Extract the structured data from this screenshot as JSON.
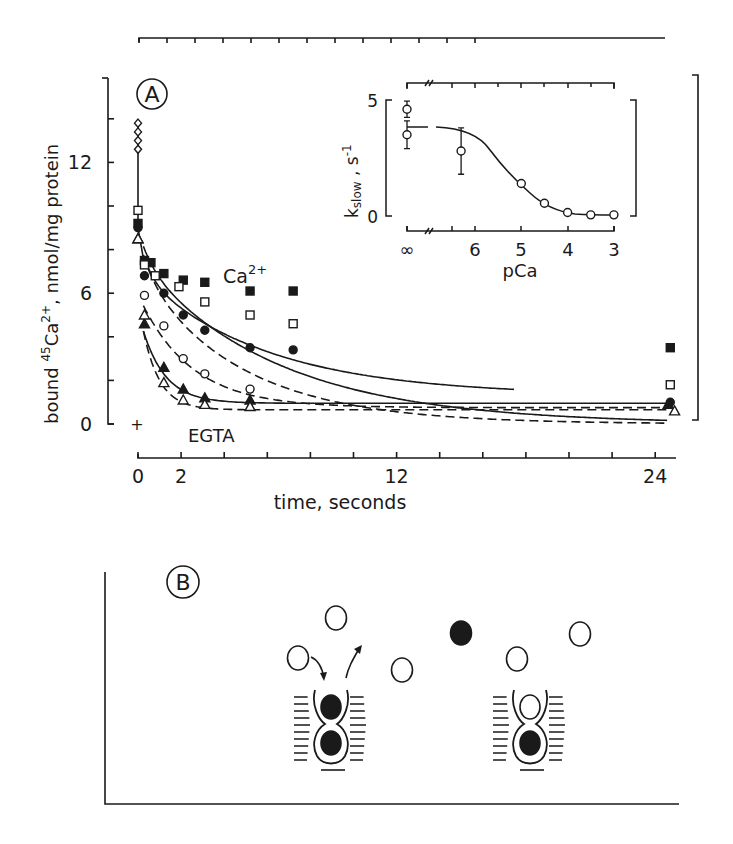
{
  "figure": {
    "panel_a_label": "A",
    "panel_b_label": "B"
  },
  "chart_data": [
    {
      "type": "scatter",
      "panel": "A",
      "title": "",
      "xlabel": "time, seconds",
      "ylabel": "bound 45Ca2+, nmol/mg protein",
      "ylabel_parts": {
        "pre": "bound ",
        "sup_mass": "45",
        "ion": "Ca",
        "sup_charge": "2+",
        "post": ", nmol/mg protein"
      },
      "xlim": [
        0,
        25.5
      ],
      "ylim": [
        0,
        15
      ],
      "x_ticks": [
        0,
        2,
        12,
        24
      ],
      "x_minor_ticks": [
        0,
        2,
        4,
        6,
        8,
        10,
        12,
        14,
        16,
        18,
        20,
        22,
        24
      ],
      "y_ticks": [
        0,
        6,
        12
      ],
      "y_minor_ticks": [
        0,
        2,
        4,
        6,
        8,
        10,
        12,
        14
      ],
      "annotations": [
        {
          "text": "Ca2+",
          "x": 4.2,
          "y": 7.0
        },
        {
          "text": "EGTA",
          "x": 2.3,
          "y": -0.7
        },
        {
          "text": "+",
          "x": 0.0,
          "y": 0.0
        }
      ],
      "initial_points": {
        "marker": "open-diamond",
        "x": 0,
        "y": [
          12.6,
          13.0,
          13.4,
          13.8
        ]
      },
      "series": [
        {
          "name": "filled squares",
          "marker": "filled-square",
          "line": "solid",
          "x": [
            0,
            0.3,
            0.6,
            1.2,
            2.1,
            3.1,
            5.2,
            7.2,
            24.7
          ],
          "y": [
            9.2,
            7.5,
            7.4,
            6.9,
            6.6,
            6.5,
            6.1,
            6.1,
            3.5
          ]
        },
        {
          "name": "open squares",
          "marker": "open-square",
          "line": "dashed",
          "x": [
            0,
            0.3,
            0.8,
            1.9,
            3.1,
            5.2,
            7.2,
            24.7
          ],
          "y": [
            9.8,
            7.3,
            6.8,
            6.3,
            5.6,
            5.0,
            4.6,
            1.8
          ]
        },
        {
          "name": "filled circles",
          "marker": "filled-circle",
          "line": "solid",
          "x": [
            0,
            0.3,
            1.2,
            2.1,
            3.1,
            5.2,
            7.2,
            24.7
          ],
          "y": [
            9.0,
            6.8,
            6.0,
            5.0,
            4.3,
            3.5,
            3.4,
            1.0
          ]
        },
        {
          "name": "open circles",
          "marker": "open-circle",
          "line": "dashed",
          "x": [
            0.3,
            1.2,
            2.1,
            3.1,
            5.2
          ],
          "y": [
            5.9,
            4.5,
            3.0,
            2.3,
            1.6
          ]
        },
        {
          "name": "filled triangles",
          "marker": "filled-triangle",
          "line": "solid",
          "x": [
            0,
            0.3,
            1.2,
            2.1,
            3.1,
            5.2,
            24.6
          ],
          "y": [
            8.5,
            4.6,
            2.6,
            1.6,
            1.2,
            1.1,
            0.9
          ]
        },
        {
          "name": "open triangles",
          "marker": "open-triangle",
          "line": "dashed",
          "x": [
            0,
            0.3,
            1.2,
            2.1,
            3.1,
            5.2,
            24.9
          ],
          "y": [
            8.5,
            5.0,
            1.9,
            1.1,
            0.9,
            0.8,
            0.6
          ]
        }
      ],
      "grid": false,
      "legend": "none"
    },
    {
      "type": "scatter",
      "panel": "A-inset",
      "title": "",
      "xlabel": "pCa",
      "ylabel": "k_slow , s-1",
      "ylabel_parts": {
        "main": "k",
        "sub": "slow",
        "post": " , s",
        "sup": "-1"
      },
      "x_tick_labels": [
        "∞",
        "6",
        "5",
        "4",
        "3"
      ],
      "y_ticks": [
        0,
        5
      ],
      "ylim": [
        0,
        5
      ],
      "axis_break": "//",
      "points": [
        {
          "pCa": "∞",
          "k": 4.6,
          "err": 0.35
        },
        {
          "pCa": "∞",
          "k": 3.5,
          "err": 0.6
        },
        {
          "pCa": 6.3,
          "k": 2.8,
          "err": 1.0
        },
        {
          "pCa": 5.0,
          "k": 1.4,
          "err": 0
        },
        {
          "pCa": 4.5,
          "k": 0.55,
          "err": 0
        },
        {
          "pCa": 4.0,
          "k": 0.15,
          "err": 0
        },
        {
          "pCa": 3.5,
          "k": 0.05,
          "err": 0
        },
        {
          "pCa": 3.0,
          "k": 0.05,
          "err": 0
        }
      ],
      "fit": "sigmoidal, plateau ~4.0 at low Ca, ~0 at high Ca, midpoint pCa ~5.1"
    }
  ],
  "diagram_b": {
    "free_ions": [
      {
        "fill": "open",
        "cx": 298,
        "cy": 658
      },
      {
        "fill": "open",
        "cx": 336,
        "cy": 618
      },
      {
        "fill": "open",
        "cx": 402,
        "cy": 670
      },
      {
        "fill": "filled",
        "cx": 461,
        "cy": 633
      },
      {
        "fill": "open",
        "cx": 517,
        "cy": 659
      },
      {
        "fill": "open",
        "cx": 580,
        "cy": 634
      }
    ],
    "sites": [
      {
        "upper": "filled",
        "lower": "filled",
        "cx": 331
      },
      {
        "upper": "open",
        "lower": "filled",
        "cx": 530
      }
    ],
    "arrows": [
      "into-site",
      "out-of-site"
    ]
  }
}
